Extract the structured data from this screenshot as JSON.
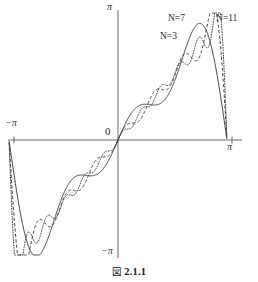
{
  "figure": {
    "caption_mark": "図",
    "caption_number": "2.1.1",
    "caption_full": "図 2.1.1"
  },
  "axes": {
    "x_label_left": "−π",
    "x_label_right": "π",
    "y_label_top": "π",
    "y_label_bottom": "−π",
    "origin_label": "0",
    "axis_color": "#555555"
  },
  "series_labels": {
    "n3": {
      "var": "N",
      "eq": "=",
      "value": "3",
      "text": "N=3"
    },
    "n7": {
      "var": "N",
      "eq": "=",
      "value": "7",
      "text": "N=7"
    },
    "n11": {
      "var": "N",
      "eq": "=",
      "value": "11",
      "text": "N=11"
    }
  },
  "chart_data": {
    "type": "line",
    "subtitle": "",
    "xlabel": "",
    "ylabel": "",
    "xlim": [
      -3.141592653589793,
      3.141592653589793
    ],
    "ylim": [
      -3.141592653589793,
      3.141592653589793
    ],
    "xticks": [
      -3.141592653589793,
      0,
      3.141592653589793
    ],
    "xticklabels": [
      "−π",
      "0",
      "π"
    ],
    "yticks": [
      -3.141592653589793,
      0,
      3.141592653589793
    ],
    "yticklabels": [
      "−π",
      "0",
      "π"
    ],
    "grid": false,
    "legend_position": "inline-annotations",
    "function": "f(x) = x on (-π, π); partial sums S_N(x) = 2 * sum_{k=1..N} ((-1)^(k+1)/k) sin(kx)",
    "annotations": [
      "N=3",
      "N=7",
      "N=11"
    ],
    "series": [
      {
        "name": "N=3",
        "N": 3,
        "style": "solid",
        "color": "#2b2b2b",
        "linewidth": 0.9
      },
      {
        "name": "N=7",
        "N": 7,
        "style": "dashed",
        "color": "#2b2b2b",
        "linewidth": 0.9
      },
      {
        "name": "N=11",
        "N": 11,
        "style": "dotted",
        "color": "#2b2b2b",
        "linewidth": 0.9
      }
    ],
    "gibbs_overshoot_note": "overshoot near x = ±π increases with N"
  }
}
